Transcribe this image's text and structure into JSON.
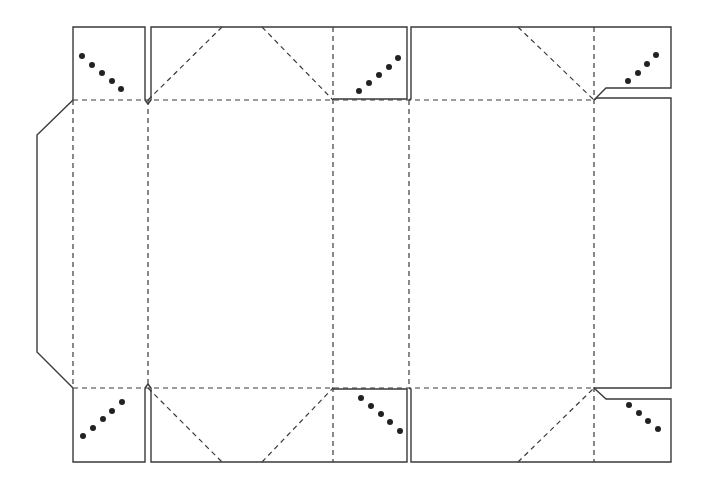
{
  "diagram": {
    "type": "box-dieline",
    "canvas": {
      "width": 704,
      "height": 491
    },
    "colors": {
      "cut_line": "#3a3a3a",
      "fold_line": "#3a3a3a",
      "dot": "#222222",
      "background": "#ffffff"
    },
    "legend": {
      "cut_line_style": "solid",
      "fold_line_style": "dashed",
      "glue_marks": "dots"
    },
    "cut_paths": [
      {
        "name": "glue-flap-left",
        "points": "73,100 37,135 37,352 73,388"
      },
      {
        "name": "top-flap-corner-left",
        "points": "73,100 73,27 145,27 145,100 148,104"
      },
      {
        "name": "top-flap-center-left",
        "points": "148,104 151,100 151,27 407,27 407,99 333,99"
      },
      {
        "name": "top-flap-center-right",
        "points": "409,100 411,99 411,27 671,27 671,88 606,88 594,100"
      },
      {
        "name": "right-panel-edge",
        "points": "594,100 597,98 671,98 671,388 597,388 594,388"
      },
      {
        "name": "bottom-flap-center-left",
        "points": "148,384 151,388 151,462 407,462 407,389 333,389"
      },
      {
        "name": "bottom-flap-corner-left",
        "points": "73,388 73,462 145,462 145,388 148,384"
      },
      {
        "name": "bottom-flap-center-right",
        "points": "409,388 411,389 411,462 671,462 671,399 606,399 594,388"
      }
    ],
    "fold_lines": [
      {
        "name": "top-horizontal-fold",
        "x1": 73,
        "y1": 100,
        "x2": 594,
        "y2": 100
      },
      {
        "name": "bottom-horizontal-fold",
        "x1": 73,
        "y1": 388,
        "x2": 594,
        "y2": 388
      },
      {
        "name": "vertical-fold-1",
        "x1": 73,
        "y1": 100,
        "x2": 73,
        "y2": 388
      },
      {
        "name": "vertical-fold-2",
        "x1": 148,
        "y1": 100,
        "x2": 148,
        "y2": 388
      },
      {
        "name": "vertical-fold-3",
        "x1": 333,
        "y1": 27,
        "x2": 333,
        "y2": 462
      },
      {
        "name": "vertical-fold-4",
        "x1": 409,
        "y1": 100,
        "x2": 409,
        "y2": 388
      },
      {
        "name": "vertical-fold-5",
        "x1": 594,
        "y1": 27,
        "x2": 594,
        "y2": 462
      },
      {
        "name": "diag-top-1",
        "x1": 148,
        "y1": 100,
        "x2": 222,
        "y2": 27
      },
      {
        "name": "diag-top-2",
        "x1": 262,
        "y1": 27,
        "x2": 333,
        "y2": 100
      },
      {
        "name": "diag-top-3",
        "x1": 518,
        "y1": 27,
        "x2": 594,
        "y2": 100
      },
      {
        "name": "diag-bottom-1",
        "x1": 148,
        "y1": 388,
        "x2": 222,
        "y2": 462
      },
      {
        "name": "diag-bottom-2",
        "x1": 262,
        "y1": 462,
        "x2": 333,
        "y2": 388
      },
      {
        "name": "diag-bottom-3",
        "x1": 518,
        "y1": 462,
        "x2": 594,
        "y2": 388
      }
    ],
    "glue_dots": [
      {
        "group": "top-left",
        "points": [
          [
            82,
            56
          ],
          [
            92,
            65
          ],
          [
            102,
            73
          ],
          [
            112,
            81
          ],
          [
            121,
            89
          ]
        ]
      },
      {
        "group": "top-middle",
        "points": [
          [
            359,
            91
          ],
          [
            369,
            83
          ],
          [
            379,
            75
          ],
          [
            389,
            67
          ],
          [
            398,
            58
          ]
        ]
      },
      {
        "group": "top-right",
        "points": [
          [
            628,
            81
          ],
          [
            638,
            73
          ],
          [
            647,
            64
          ],
          [
            656,
            55
          ]
        ]
      },
      {
        "group": "bottom-left",
        "points": [
          [
            83,
            436
          ],
          [
            93,
            428
          ],
          [
            103,
            419
          ],
          [
            112,
            411
          ],
          [
            122,
            402
          ]
        ]
      },
      {
        "group": "bottom-middle",
        "points": [
          [
            361,
            398
          ],
          [
            371,
            406
          ],
          [
            381,
            414
          ],
          [
            390,
            422
          ],
          [
            400,
            431
          ]
        ]
      },
      {
        "group": "bottom-right",
        "points": [
          [
            629,
            405
          ],
          [
            639,
            413
          ],
          [
            648,
            421
          ],
          [
            658,
            429
          ]
        ]
      }
    ],
    "dot_radius": 3
  }
}
